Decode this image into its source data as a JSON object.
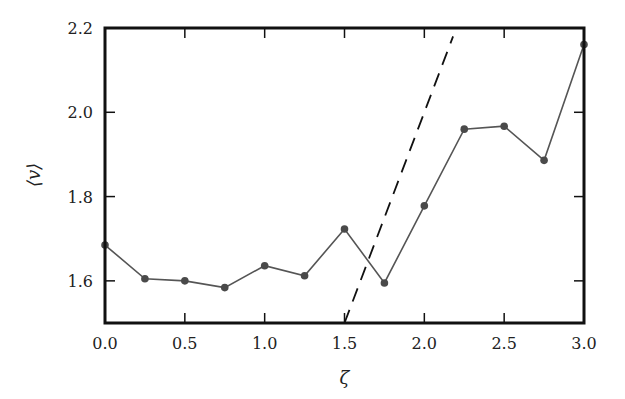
{
  "chart_data": {
    "type": "line",
    "title": "",
    "xlabel": "ζ",
    "ylabel": "⟨v⟩",
    "xlim": [
      0.0,
      3.0
    ],
    "ylim": [
      1.5,
      2.2
    ],
    "xticks": [
      0.0,
      0.5,
      1.0,
      1.5,
      2.0,
      2.5,
      3.0
    ],
    "xtick_labels": [
      "0.0",
      "0.5",
      "1.0",
      "1.5",
      "2.0",
      "2.5",
      "3.0"
    ],
    "yticks": [
      1.6,
      1.8,
      2.0,
      2.2
    ],
    "ytick_labels": [
      "1.6",
      "1.8",
      "2.0",
      "2.2"
    ],
    "grid": false,
    "legend": null,
    "series": [
      {
        "name": "⟨v⟩ data",
        "style": "solid line with circle markers",
        "color": "#555555",
        "x": [
          0.0,
          0.25,
          0.5,
          0.75,
          1.0,
          1.25,
          1.5,
          1.75,
          2.0,
          2.25,
          2.5,
          2.75,
          3.0
        ],
        "values": [
          1.685,
          1.605,
          1.6,
          1.584,
          1.636,
          1.612,
          1.723,
          1.595,
          1.778,
          1.96,
          1.967,
          1.886,
          2.161
        ]
      },
      {
        "name": "reference line",
        "style": "dashed",
        "color": "#111111",
        "x": [
          1.5,
          2.18
        ],
        "values": [
          1.5,
          2.18
        ]
      }
    ]
  }
}
